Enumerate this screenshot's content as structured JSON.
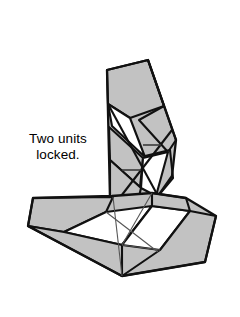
{
  "figure": {
    "caption_lines": [
      "Two units",
      "locked."
    ],
    "background_color": "#ffffff",
    "fill_color": "#c2c2c2",
    "stroke_color": "#000000",
    "text_color": "#000000",
    "width": 240,
    "height": 317
  },
  "geometry": {
    "vertical_unit": {
      "outline": "107,70 148,60 176,140 172,176 158,196 120,202 110,198",
      "faces": [
        {
          "name": "upper-front-face",
          "points": "107,70 148,60 164,106 130,118 108,104",
          "fill": "#c2c2c2"
        },
        {
          "name": "upper-right-face",
          "points": "148,60 176,140 168,152 139,120 164,106",
          "fill": "#c2c2c2"
        },
        {
          "name": "upper-white-gap",
          "points": "108,104 130,118 143,155 112,126",
          "fill": "#ffffff"
        },
        {
          "name": "mid-left-face",
          "points": "108,128 143,158 140,186 110,160",
          "fill": "#c2c2c2"
        },
        {
          "name": "mid-right-face",
          "points": "145,156 170,152 173,178 158,196 147,186",
          "fill": "#c2c2c2"
        },
        {
          "name": "lower-white-gap",
          "points": "143,158 168,152 156,196 141,188",
          "fill": "#ffffff"
        },
        {
          "name": "lower-left-face",
          "points": "110,160 141,188 137,200 110,198",
          "fill": "#c2c2c2"
        }
      ],
      "tick_marks": [
        {
          "name": "upper-tick",
          "x1": 143,
          "y1": 145,
          "x2": 161,
          "y2": 145
        },
        {
          "name": "lower-tick",
          "x1": 122,
          "y1": 170,
          "x2": 141,
          "y2": 170
        }
      ]
    },
    "horizontal_unit": {
      "outline": "33,198 110,196 152,193 186,198 216,216 205,262 122,276 28,226",
      "faces": [
        {
          "name": "left-arm-face",
          "points": "33,198 112,197 106,212 64,232 28,226",
          "fill": "#c2c2c2"
        },
        {
          "name": "left-white-gap",
          "points": "64,232 106,212 152,206 122,243",
          "fill": "#ffffff"
        },
        {
          "name": "center-lower-face",
          "points": "28,226 64,232 122,243 122,276",
          "fill": "#c2c2c2"
        },
        {
          "name": "center-right-face",
          "points": "122,243 152,206 190,210 160,250",
          "fill": "#ffffff"
        },
        {
          "name": "right-arm-face",
          "points": "152,193 186,198 216,216 205,262 122,276 160,250 190,210",
          "fill": "#c2c2c2"
        }
      ],
      "crease_lines": [
        {
          "name": "crease-a",
          "x1": 112,
          "y1": 197,
          "x2": 122,
          "y2": 276
        },
        {
          "name": "crease-b",
          "x1": 106,
          "y1": 212,
          "x2": 152,
          "y2": 250
        },
        {
          "name": "crease-c",
          "x1": 122,
          "y1": 243,
          "x2": 160,
          "y2": 250
        }
      ]
    }
  }
}
